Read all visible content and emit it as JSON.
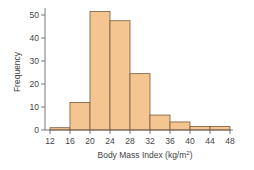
{
  "chart_data": {
    "type": "bar",
    "subtype": "histogram",
    "title": "",
    "xlabel": "Body Mass Index (kg/m²)",
    "xlabel_base": "Body Mass Index (kg/m",
    "xlabel_sup": "2",
    "xlabel_end": ")",
    "ylabel": "Frequency",
    "bin_edges": [
      12,
      16,
      20,
      24,
      28,
      32,
      36,
      40,
      44,
      48
    ],
    "categories": [
      "12-16",
      "16-20",
      "20-24",
      "24-28",
      "28-32",
      "32-36",
      "36-40",
      "40-44",
      "44-48"
    ],
    "values": [
      1,
      12,
      51.5,
      47.5,
      24.5,
      6.5,
      3.5,
      1.5,
      1.5
    ],
    "x_ticks": [
      12,
      16,
      20,
      24,
      28,
      32,
      36,
      40,
      44,
      48
    ],
    "y_ticks": [
      0,
      10,
      20,
      30,
      40,
      50
    ],
    "xlim": [
      12,
      48
    ],
    "ylim": [
      0,
      55
    ],
    "grid": false,
    "legend": null,
    "colors": {
      "bar_fill": "#f4c590",
      "bar_stroke": "#7a5a3a",
      "axis": "#555555"
    }
  }
}
